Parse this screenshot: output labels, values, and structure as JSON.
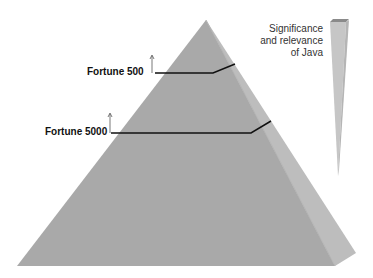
{
  "diagram": {
    "type": "pyramid",
    "levels": [
      {
        "label": "Fortune 500"
      },
      {
        "label": "Fortune 5000"
      }
    ],
    "wedge_label": [
      "Significance",
      "and relevance",
      "of Java"
    ],
    "colors": {
      "pyramid_front": "#a8a8a8",
      "pyramid_side": "#bcbcbc",
      "wedge_front": "#c4c4c4",
      "wedge_top": "#888888",
      "lines": "#111111"
    }
  }
}
